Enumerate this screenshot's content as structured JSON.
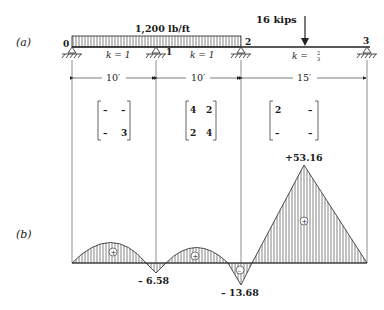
{
  "part_labels": {
    "a": "(a)",
    "b": "(b)"
  },
  "beam": {
    "distributed_load": "1,200 lb/ft",
    "point_load": "16 kips",
    "supports": [
      "0",
      "1",
      "2",
      "3"
    ],
    "spans": [
      {
        "stiffness": "k = 1",
        "length": "10′",
        "matrix": [
          [
            "–",
            "–"
          ],
          [
            "–",
            "3"
          ]
        ]
      },
      {
        "stiffness": "k = 1",
        "length": "10′",
        "matrix": [
          [
            "4",
            "2"
          ],
          [
            "2",
            "4"
          ]
        ]
      },
      {
        "stiffness_prefix": "k = ",
        "stiffness_num": "2",
        "stiffness_den": "3",
        "length": "15′",
        "matrix": [
          [
            "2",
            "–"
          ],
          [
            "–",
            "–"
          ]
        ]
      }
    ]
  },
  "moment_diagram": {
    "values": {
      "support1": "– 6.58",
      "support2": "– 13.68",
      "peak_span3": "+53.16"
    },
    "signs": {
      "span1": "+",
      "span2": "+",
      "near_support2": "–",
      "span3": "+"
    }
  }
}
